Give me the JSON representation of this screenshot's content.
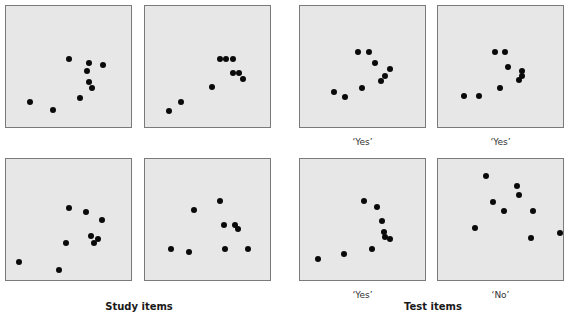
{
  "figure": {
    "panel_size": [
      127,
      123
    ],
    "dot_color": "#0a0a0a",
    "panel_fill": "#e7e7e7",
    "panel_border": "#7a7a7a"
  },
  "groups": {
    "study": {
      "label": "Study items"
    },
    "test": {
      "label": "Test items"
    }
  },
  "panels": [
    {
      "id": "study-1",
      "group": "study",
      "x": 5,
      "y": 5,
      "label": "",
      "dots": [
        [
          63,
          53
        ],
        [
          83,
          57
        ],
        [
          97,
          59
        ],
        [
          81,
          65
        ],
        [
          83,
          76
        ],
        [
          86,
          82
        ],
        [
          74,
          92
        ],
        [
          24,
          96
        ],
        [
          47,
          104
        ]
      ]
    },
    {
      "id": "study-2",
      "group": "study",
      "x": 144,
      "y": 5,
      "label": "",
      "dots": [
        [
          75,
          53
        ],
        [
          81,
          53
        ],
        [
          88,
          53
        ],
        [
          88,
          67
        ],
        [
          94,
          67
        ],
        [
          98,
          73
        ],
        [
          67,
          81
        ],
        [
          36,
          96
        ],
        [
          24,
          105
        ]
      ]
    },
    {
      "id": "study-3",
      "group": "study",
      "x": 5,
      "y": 158,
      "label": "",
      "dots": [
        [
          63,
          49
        ],
        [
          80,
          53
        ],
        [
          96,
          61
        ],
        [
          85,
          77
        ],
        [
          92,
          80
        ],
        [
          88,
          84
        ],
        [
          60,
          84
        ],
        [
          13,
          103
        ],
        [
          53,
          111
        ]
      ]
    },
    {
      "id": "study-4",
      "group": "study",
      "x": 144,
      "y": 158,
      "label": "",
      "dots": [
        [
          75,
          42
        ],
        [
          49,
          51
        ],
        [
          79,
          66
        ],
        [
          90,
          66
        ],
        [
          93,
          70
        ],
        [
          26,
          90
        ],
        [
          44,
          93
        ],
        [
          80,
          90
        ],
        [
          103,
          90
        ]
      ]
    },
    {
      "id": "test-1",
      "group": "test",
      "x": 299,
      "y": 5,
      "label": "‘Yes’",
      "dots": [
        [
          58,
          46
        ],
        [
          69,
          46
        ],
        [
          75,
          57
        ],
        [
          90,
          63
        ],
        [
          85,
          70
        ],
        [
          81,
          75
        ],
        [
          62,
          82
        ],
        [
          34,
          86
        ],
        [
          45,
          91
        ]
      ]
    },
    {
      "id": "test-2",
      "group": "test",
      "x": 437,
      "y": 5,
      "label": "‘Yes’",
      "dots": [
        [
          57,
          46
        ],
        [
          67,
          46
        ],
        [
          70,
          61
        ],
        [
          84,
          65
        ],
        [
          84,
          70
        ],
        [
          81,
          74
        ],
        [
          62,
          82
        ],
        [
          26,
          90
        ],
        [
          41,
          90
        ]
      ]
    },
    {
      "id": "test-3",
      "group": "test",
      "x": 299,
      "y": 158,
      "label": "‘Yes’",
      "dots": [
        [
          64,
          42
        ],
        [
          77,
          48
        ],
        [
          82,
          62
        ],
        [
          84,
          73
        ],
        [
          85,
          78
        ],
        [
          90,
          80
        ],
        [
          72,
          90
        ],
        [
          44,
          95
        ],
        [
          18,
          100
        ]
      ]
    },
    {
      "id": "test-4",
      "group": "test",
      "x": 437,
      "y": 158,
      "label": "‘No’",
      "dots": [
        [
          48,
          17
        ],
        [
          79,
          27
        ],
        [
          81,
          36
        ],
        [
          55,
          43
        ],
        [
          66,
          52
        ],
        [
          95,
          52
        ],
        [
          37,
          69
        ],
        [
          93,
          79
        ],
        [
          122,
          74
        ]
      ]
    }
  ]
}
